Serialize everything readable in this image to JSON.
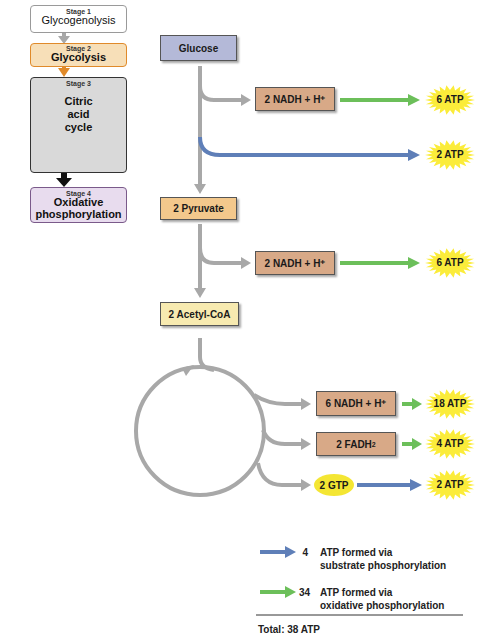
{
  "stages": [
    {
      "label": "Stage 1",
      "name": "Glycogenolysis",
      "color": "#ffffff",
      "border": "#9a9a9a"
    },
    {
      "label": "Stage 2",
      "name": "Glycolysis",
      "color": "#f7dfb8",
      "border": "#e08a2a"
    },
    {
      "label": "Stage 3",
      "name": "Citric acid cycle",
      "name_lines": [
        "Citric",
        "acid",
        "cycle"
      ],
      "color": "#d9d9d9",
      "border": "#333333"
    },
    {
      "label": "Stage 4",
      "name": "Oxidative phosphorylation",
      "name_lines": [
        "Oxidative",
        "phosphorylation"
      ],
      "color": "#e8dcee",
      "border": "#7a5a8a"
    }
  ],
  "pathway": {
    "glucose": "Glucose",
    "pyruvate": "2 Pyruvate",
    "acetyl_coa": "2 Acetyl-CoA",
    "nadh_1": "2 NADH + H⁺",
    "nadh_2": "2 NADH + H⁺",
    "nadh_3": "6 NADH + H⁺",
    "fadh2": "2 FADH",
    "fadh2_sub": "2",
    "gtp": "2 GTP"
  },
  "atp_yields": [
    {
      "id": "glycolysis_nadh",
      "label": "6 ATP",
      "via": "oxidative"
    },
    {
      "id": "glycolysis_substrate",
      "label": "2 ATP",
      "via": "substrate"
    },
    {
      "id": "pyruvate_nadh",
      "label": "6 ATP",
      "via": "oxidative"
    },
    {
      "id": "cycle_nadh",
      "label": "18 ATP",
      "via": "oxidative"
    },
    {
      "id": "cycle_fadh2",
      "label": "4 ATP",
      "via": "oxidative"
    },
    {
      "id": "cycle_gtp",
      "label": "2 ATP",
      "via": "substrate"
    }
  ],
  "legend": {
    "substrate": {
      "count": "4",
      "line1": "ATP formed via",
      "line2": "substrate phosphorylation"
    },
    "oxidative": {
      "count": "34",
      "line1": "ATP formed via",
      "line2": "oxidative phosphorylation"
    },
    "total": "Total: 38 ATP"
  },
  "colors": {
    "glucose_box": "#b4b9d8",
    "pyruvate_box": "#f3c88c",
    "acetyl_box": "#f7eab0",
    "nadh_box": "#d8a987",
    "gtp_oval": "#f4e633",
    "burst": "#fbec3a",
    "gray_arrow": "#a8a8a8",
    "blue_arrow": "#5f7fb8",
    "green_arrow": "#6cbf5a"
  }
}
